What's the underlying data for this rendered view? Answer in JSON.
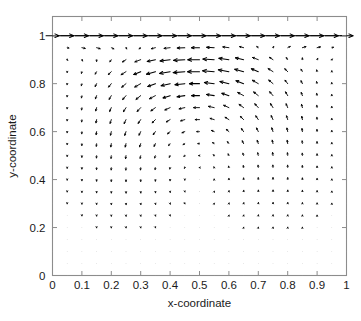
{
  "chart_data": {
    "type": "quiver",
    "title": "",
    "xlabel": "x-coordinate",
    "ylabel": "y-coordinate",
    "xlim": [
      0,
      1
    ],
    "ylim": [
      0,
      1.08
    ],
    "xticks": [
      0,
      0.1,
      0.2,
      0.3,
      0.4,
      0.5,
      0.6,
      0.7,
      0.8,
      0.9,
      1
    ],
    "yticks": [
      0,
      0.2,
      0.4,
      0.6,
      0.8,
      1
    ],
    "xtick_labels": [
      "0",
      "0.1",
      "0.2",
      "0.3",
      "0.4",
      "0.5",
      "0.6",
      "0.7",
      "0.8",
      "0.9",
      "1"
    ],
    "ytick_labels": [
      "0",
      "0.2",
      "0.4",
      "0.6",
      "0.8",
      "1"
    ],
    "grid": false,
    "legend": null,
    "grid_spacing": 0.05,
    "grid_nx": 21,
    "grid_ny": 21,
    "vortex_center": [
      0.5,
      0.73
    ],
    "lid_velocity": 1.0,
    "arrow_color": "#000000",
    "axis_color": "#8c8c8c",
    "lid_line_y": 1.0,
    "vector_scale": 0.052,
    "series": [
      {
        "name": "velocity",
        "note": "u,v components sampled on a 21x21 uniform grid over x,y in [0,1]; magnitudes normalised so the lid speed is 1."
      }
    ]
  },
  "axes": {
    "x_title": "x-coordinate",
    "y_title": "y-coordinate"
  }
}
